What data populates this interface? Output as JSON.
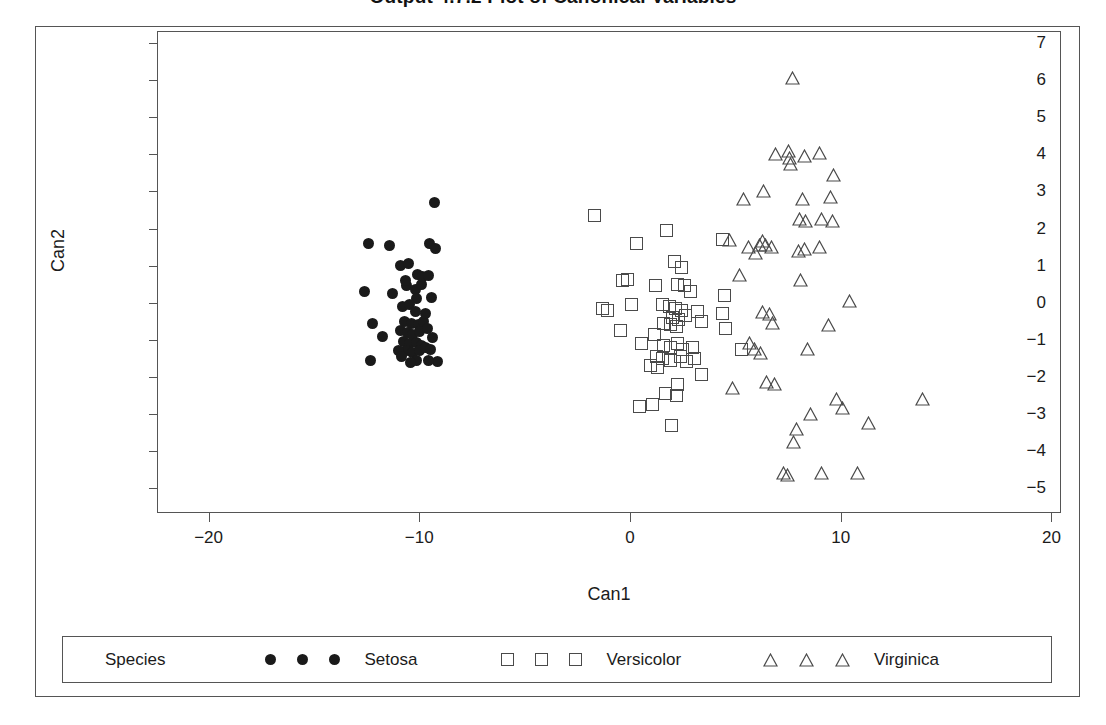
{
  "chart_data": {
    "type": "scatter",
    "title": "Output 4.7.2   Plot of Canonical Variables",
    "xlabel": "Can1",
    "ylabel": "Can2",
    "xlim": [
      -22.4,
      20.5
    ],
    "ylim": [
      -5.7,
      7.3
    ],
    "xticks": [
      -20,
      -10,
      0,
      10,
      20
    ],
    "yticks": [
      7,
      6,
      5,
      4,
      3,
      2,
      1,
      0,
      -1,
      -2,
      -3,
      -4,
      -5
    ],
    "xtick_labels": [
      "−20",
      "−10",
      "0",
      "10",
      "20"
    ],
    "ytick_labels": [
      "7",
      "6",
      "5",
      "4",
      "3",
      "2",
      "1",
      "0",
      "−1",
      "−2",
      "−3",
      "−4",
      "−5"
    ],
    "grid": false,
    "legend_position": "bottom",
    "legend_title": "Species",
    "series": [
      {
        "name": "Setosa",
        "marker": "filled-circle",
        "color": "#1a1a1a",
        "points": [
          [
            -9.3,
            2.7
          ],
          [
            -12.4,
            1.6
          ],
          [
            -11.4,
            1.55
          ],
          [
            -9.5,
            1.6
          ],
          [
            -9.25,
            1.45
          ],
          [
            -10.9,
            1.0
          ],
          [
            -10.5,
            1.05
          ],
          [
            -10.1,
            0.75
          ],
          [
            -9.85,
            0.7
          ],
          [
            -9.55,
            0.72
          ],
          [
            -10.6,
            0.45
          ],
          [
            -10.2,
            0.35
          ],
          [
            -9.9,
            0.5
          ],
          [
            -11.25,
            0.25
          ],
          [
            -12.6,
            0.3
          ],
          [
            -10.15,
            0.1
          ],
          [
            -9.4,
            0.15
          ],
          [
            -10.8,
            -0.1
          ],
          [
            -10.45,
            -0.05
          ],
          [
            -10.2,
            -0.25
          ],
          [
            -12.2,
            -0.55
          ],
          [
            -11.75,
            -0.9
          ],
          [
            -10.7,
            -0.5
          ],
          [
            -10.35,
            -0.55
          ],
          [
            -10.05,
            -0.6
          ],
          [
            -9.8,
            -0.52
          ],
          [
            -10.9,
            -0.75
          ],
          [
            -10.55,
            -0.8
          ],
          [
            -10.3,
            -0.85
          ],
          [
            -10.0,
            -0.78
          ],
          [
            -9.6,
            -0.7
          ],
          [
            -9.35,
            -0.95
          ],
          [
            -10.75,
            -1.05
          ],
          [
            -10.45,
            -1.1
          ],
          [
            -10.15,
            -1.08
          ],
          [
            -9.9,
            -1.15
          ],
          [
            -10.6,
            -1.3
          ],
          [
            -10.3,
            -1.35
          ],
          [
            -10.0,
            -1.3
          ],
          [
            -9.7,
            -1.2
          ],
          [
            -9.45,
            -1.25
          ],
          [
            -11.0,
            -1.3
          ],
          [
            -10.85,
            -1.45
          ],
          [
            -12.3,
            -1.55
          ],
          [
            -9.15,
            -1.6
          ],
          [
            -9.55,
            -1.55
          ],
          [
            -10.15,
            -1.55
          ],
          [
            -10.4,
            -1.62
          ],
          [
            -10.65,
            0.6
          ],
          [
            -9.7,
            -0.3
          ]
        ]
      },
      {
        "name": "Versicolor",
        "marker": "open-square",
        "color": "#4a4a4a",
        "points": [
          [
            -1.7,
            2.35
          ],
          [
            0.3,
            1.6
          ],
          [
            1.75,
            1.95
          ],
          [
            -0.35,
            0.6
          ],
          [
            -0.1,
            0.62
          ],
          [
            2.1,
            1.1
          ],
          [
            2.45,
            0.95
          ],
          [
            4.4,
            1.7
          ],
          [
            1.2,
            0.45
          ],
          [
            2.25,
            0.5
          ],
          [
            2.6,
            0.45
          ],
          [
            2.85,
            0.3
          ],
          [
            -1.3,
            -0.15
          ],
          [
            -1.05,
            -0.2
          ],
          [
            1.55,
            -0.05
          ],
          [
            1.85,
            -0.1
          ],
          [
            2.15,
            -0.15
          ],
          [
            2.45,
            -0.2
          ],
          [
            2.0,
            -0.4
          ],
          [
            2.3,
            -0.45
          ],
          [
            2.65,
            -0.35
          ],
          [
            3.2,
            -0.25
          ],
          [
            3.4,
            -0.5
          ],
          [
            1.6,
            -0.55
          ],
          [
            1.9,
            -0.6
          ],
          [
            2.2,
            -0.65
          ],
          [
            -0.45,
            -0.75
          ],
          [
            4.4,
            -0.3
          ],
          [
            4.55,
            -0.7
          ],
          [
            0.55,
            -1.1
          ],
          [
            1.6,
            -1.15
          ],
          [
            1.9,
            -1.2
          ],
          [
            2.25,
            -1.1
          ],
          [
            2.5,
            -1.25
          ],
          [
            2.95,
            -1.2
          ],
          [
            1.25,
            -1.45
          ],
          [
            1.55,
            -1.5
          ],
          [
            1.9,
            -1.55
          ],
          [
            2.4,
            -1.45
          ],
          [
            2.7,
            -1.6
          ],
          [
            3.05,
            -1.5
          ],
          [
            5.3,
            -1.25
          ],
          [
            0.95,
            -1.7
          ],
          [
            1.3,
            -1.75
          ],
          [
            3.4,
            -1.95
          ],
          [
            2.25,
            -2.2
          ],
          [
            0.45,
            -2.8
          ],
          [
            1.05,
            -2.75
          ],
          [
            1.7,
            -2.45
          ],
          [
            2.2,
            -2.5
          ],
          [
            1.95,
            -3.3
          ],
          [
            0.05,
            -0.05
          ],
          [
            1.15,
            -0.85
          ],
          [
            4.5,
            0.2
          ]
        ]
      },
      {
        "name": "Virginica",
        "marker": "open-triangle",
        "color": "#4a4a4a",
        "points": [
          [
            7.7,
            6.05
          ],
          [
            6.9,
            4.0
          ],
          [
            7.5,
            4.1
          ],
          [
            7.55,
            3.9
          ],
          [
            7.6,
            3.75
          ],
          [
            8.3,
            3.95
          ],
          [
            9.0,
            4.05
          ],
          [
            9.65,
            3.45
          ],
          [
            6.35,
            3.0
          ],
          [
            8.2,
            2.8
          ],
          [
            9.5,
            2.85
          ],
          [
            5.4,
            2.8
          ],
          [
            9.1,
            2.25
          ],
          [
            9.6,
            2.2
          ],
          [
            8.05,
            2.25
          ],
          [
            8.35,
            2.2
          ],
          [
            4.7,
            1.7
          ],
          [
            5.6,
            1.5
          ],
          [
            5.95,
            1.35
          ],
          [
            6.15,
            1.55
          ],
          [
            6.3,
            1.65
          ],
          [
            6.45,
            1.55
          ],
          [
            6.7,
            1.5
          ],
          [
            8.0,
            1.4
          ],
          [
            8.3,
            1.45
          ],
          [
            9.0,
            1.5
          ],
          [
            5.2,
            0.75
          ],
          [
            8.1,
            0.6
          ],
          [
            10.4,
            0.05
          ],
          [
            6.3,
            -0.25
          ],
          [
            6.6,
            -0.3
          ],
          [
            6.75,
            -0.55
          ],
          [
            9.4,
            -0.6
          ],
          [
            5.65,
            -1.1
          ],
          [
            5.9,
            -1.25
          ],
          [
            6.2,
            -1.35
          ],
          [
            8.4,
            -1.25
          ],
          [
            4.85,
            -2.3
          ],
          [
            6.5,
            -2.15
          ],
          [
            6.85,
            -2.2
          ],
          [
            9.8,
            -2.6
          ],
          [
            13.9,
            -2.6
          ],
          [
            8.55,
            -3.0
          ],
          [
            10.1,
            -2.85
          ],
          [
            7.9,
            -3.4
          ],
          [
            7.75,
            -3.75
          ],
          [
            11.3,
            -3.25
          ],
          [
            7.3,
            -4.6
          ],
          [
            7.45,
            -4.65
          ],
          [
            9.1,
            -4.6
          ],
          [
            10.8,
            -4.6
          ]
        ]
      }
    ]
  },
  "legend": {
    "title": "Species",
    "entries": [
      {
        "label": "Setosa",
        "marker": "filled-circle",
        "count": 3
      },
      {
        "label": "Versicolor",
        "marker": "open-square",
        "count": 3
      },
      {
        "label": "Virginica",
        "marker": "open-triangle",
        "count": 3
      }
    ]
  }
}
